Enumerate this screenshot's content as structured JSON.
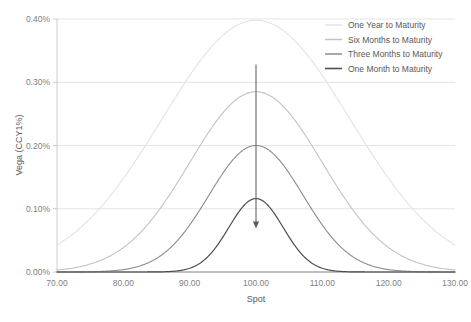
{
  "chart_data": {
    "type": "line",
    "title": "",
    "xlabel": "Spot",
    "ylabel": "Vega (CCY1%)",
    "xlim": [
      70,
      130
    ],
    "ylim": [
      0,
      0.004
    ],
    "grid": true,
    "legend_position": "top-right",
    "xticks": [
      70,
      80,
      90,
      100,
      110,
      120,
      130
    ],
    "xtick_labels": [
      "70.00",
      "80.00",
      "90.00",
      "100.00",
      "110.00",
      "120.00",
      "130.00"
    ],
    "yticks": [
      0,
      0.001,
      0.002,
      0.003,
      0.004
    ],
    "ytick_labels": [
      "0.00%",
      "0.10%",
      "0.20%",
      "0.30%",
      "0.40%"
    ],
    "center": 100,
    "series": [
      {
        "name": "One Year to Maturity",
        "color": "#e3e3e3",
        "width": 1.1,
        "peak": 0.00398,
        "sigma": 14.2
      },
      {
        "name": "Six Months to Maturity",
        "color": "#c2c2c2",
        "width": 1.1,
        "peak": 0.00285,
        "sigma": 10.0
      },
      {
        "name": "Three Months to Maturity",
        "color": "#8c8c8c",
        "width": 1.1,
        "peak": 0.002,
        "sigma": 7.1
      },
      {
        "name": "One Month to Maturity",
        "color": "#4d4d4d",
        "width": 1.2,
        "peak": 0.00116,
        "sigma": 4.1
      }
    ],
    "annotation": {
      "name": "downward-arrow",
      "x": 100,
      "y_start": 0.00328,
      "y_end": 0.00072,
      "color": "#595959"
    }
  },
  "legend": {
    "items": [
      "One Year to Maturity",
      "Six Months to Maturity",
      "Three Months to Maturity",
      "One Month to Maturity"
    ]
  }
}
